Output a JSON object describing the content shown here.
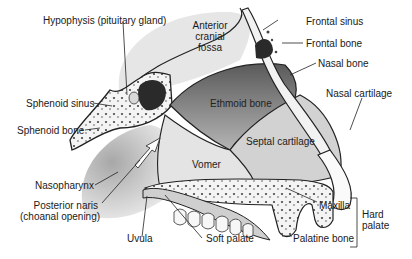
{
  "diagram": {
    "type": "anatomical-illustration",
    "labels": {
      "hypophysis": "Hypophysis (pituitary gland)",
      "anterior_cranial_fossa_1": "Anterior",
      "anterior_cranial_fossa_2": "cranial",
      "anterior_cranial_fossa_3": "fossa",
      "frontal_sinus": "Frontal sinus",
      "frontal_bone": "Frontal bone",
      "nasal_bone": "Nasal bone",
      "nasal_cartilage": "Nasal  cartilage",
      "sphenoid_sinus": "Sphenoid sinus",
      "sphenoid_bone": "Sphenoid bone",
      "ethmoid_bone": "Ethmoid bone",
      "septal_cartilage": "Septal  cartilage",
      "vomer": "Vomer",
      "nasopharynx": "Nasopharynx",
      "posterior_naris_1": "Posterior naris",
      "posterior_naris_2": "(choanal opening)",
      "uvula": "Uvula",
      "soft_palate": "Soft palate",
      "maxilla": "Maxilla",
      "palatine_bone": "Palatine bone",
      "hard_palate_1": "Hard",
      "hard_palate_2": "palate"
    }
  }
}
